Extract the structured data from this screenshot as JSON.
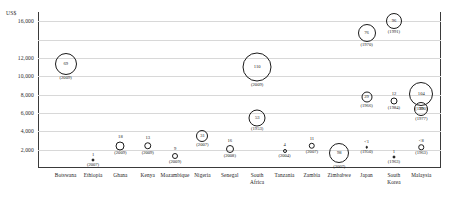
{
  "chart_data": {
    "type": "scatter",
    "title": "",
    "subtitle": "",
    "xlabel": "",
    "ylabel": "US$",
    "axis_title": "US$",
    "ylim": [
      0,
      17000
    ],
    "grid": true,
    "legend": "none",
    "ytick_labels": [
      "16,000",
      "12,000",
      "10,000",
      "8,000",
      "6,000",
      "4,000",
      "2,000"
    ],
    "ytick_values": [
      16000,
      12000,
      10000,
      8000,
      6000,
      4000,
      2000
    ],
    "gridline_values": [
      16000,
      14000,
      12000,
      10000,
      8000,
      6000,
      4000,
      2000
    ],
    "categories": [
      "Botswana",
      "Ethiopia",
      "Ghana",
      "Kenya",
      "Mozambique",
      "Nigeria",
      "Senegal",
      "South\nAfrica",
      "Tanzania",
      "Zambia",
      "Zimbabwe",
      "Japan",
      "South\nKorea",
      "Malaysia"
    ],
    "points": [
      {
        "category": "Botswana",
        "cat_index": 0,
        "value": "69",
        "year": "(2009)",
        "y": 11300,
        "size": 22,
        "marker": "circle",
        "value_pos": "inside"
      },
      {
        "category": "Ethiopia",
        "cat_index": 1,
        "value": "1",
        "year": "(2007)",
        "y": 850,
        "size": 3,
        "marker": "dot",
        "value_pos": "above"
      },
      {
        "category": "Ghana",
        "cat_index": 2,
        "value": "18",
        "year": "(2009)",
        "y": 2450,
        "size": 9,
        "marker": "circle",
        "value_pos": "above"
      },
      {
        "category": "Kenya",
        "cat_index": 3,
        "value": "13",
        "year": "(2009)",
        "y": 2400,
        "size": 7.5,
        "marker": "circle",
        "value_pos": "above"
      },
      {
        "category": "Mozambique",
        "cat_index": 4,
        "value": "9",
        "year": "(2009)",
        "y": 1350,
        "size": 6,
        "marker": "circle",
        "value_pos": "above"
      },
      {
        "category": "Nigeria",
        "cat_index": 5,
        "value": "31",
        "year": "(2007)",
        "y": 3500,
        "size": 12,
        "marker": "circle",
        "value_pos": "inside"
      },
      {
        "category": "Senegal",
        "cat_index": 6,
        "value": "16",
        "year": "(2008)",
        "y": 2050,
        "size": 8,
        "marker": "circle",
        "value_pos": "above"
      },
      {
        "category": "South Africa",
        "cat_index": 7,
        "value": "110",
        "year": "(2009)",
        "y": 11000,
        "size": 29,
        "marker": "circle",
        "value_pos": "inside"
      },
      {
        "category": "South Africa",
        "cat_index": 7,
        "value": "53",
        "year": "(1953)",
        "y": 5500,
        "size": 17,
        "marker": "circle",
        "value_pos": "inside"
      },
      {
        "category": "Tanzania",
        "cat_index": 8,
        "value": "4",
        "year": "(2004)",
        "y": 1850,
        "size": 4,
        "marker": "circle",
        "value_pos": "above"
      },
      {
        "category": "Zambia",
        "cat_index": 9,
        "value": "11",
        "year": "(2007)",
        "y": 2400,
        "size": 6.5,
        "marker": "circle",
        "value_pos": "above"
      },
      {
        "category": "Zimbabwe",
        "cat_index": 10,
        "value": "98",
        "year": "(2007)",
        "y": 1600,
        "size": 20,
        "marker": "circle",
        "value_pos": "inside"
      },
      {
        "category": "Japan",
        "cat_index": 11,
        "value": "76",
        "year": "(1970)",
        "y": 14750,
        "size": 18,
        "marker": "circle",
        "value_pos": "inside"
      },
      {
        "category": "Japan",
        "cat_index": 11,
        "value": "29",
        "year": "(1966)",
        "y": 7750,
        "size": 11,
        "marker": "circle",
        "value_pos": "inside"
      },
      {
        "category": "Japan",
        "cat_index": 11,
        "value": "<1",
        "year": "(1950)",
        "y": 2250,
        "size": 2.5,
        "marker": "dot",
        "value_pos": "above"
      },
      {
        "category": "South Korea",
        "cat_index": 12,
        "value": "96",
        "year": "(1991)",
        "y": 16050,
        "size": 16,
        "marker": "circle",
        "value_pos": "inside"
      },
      {
        "category": "South Korea",
        "cat_index": 12,
        "value": "12",
        "year": "(1984)",
        "y": 7250,
        "size": 7,
        "marker": "circle",
        "value_pos": "above"
      },
      {
        "category": "South Korea",
        "cat_index": 12,
        "value": "1",
        "year": "(1963)",
        "y": 1200,
        "size": 3,
        "marker": "dot",
        "value_pos": "above"
      },
      {
        "category": "Malaysia",
        "cat_index": 13,
        "value": "104",
        "year": "(1990)",
        "y": 8100,
        "size": 24,
        "marker": "circle",
        "value_pos": "inside"
      },
      {
        "category": "Malaysia",
        "cat_index": 13,
        "value": "39",
        "year": "(1977)",
        "y": 6400,
        "size": 14,
        "marker": "circle",
        "value_pos": "inside"
      },
      {
        "category": "Malaysia",
        "cat_index": 13,
        "value": "<8",
        "year": "(1963)",
        "y": 2250,
        "size": 5.5,
        "marker": "circle",
        "value_pos": "above"
      }
    ]
  }
}
